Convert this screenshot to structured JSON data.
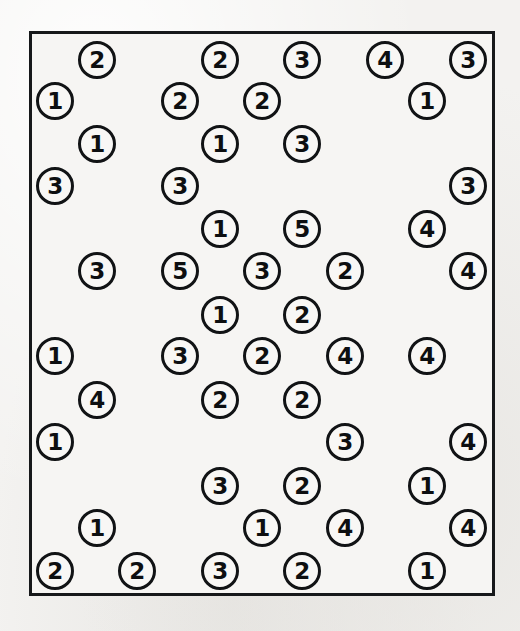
{
  "image": {
    "kind": "scanned-worksheet-scatter-of-numbered-circles",
    "background_color": "#f3f2f0",
    "frame": {
      "name": "bounding-rectangle",
      "stroke_color": "#16181a",
      "fill_color": "#f6f5f3",
      "x": 29,
      "y": 31,
      "width": 466,
      "height": 565,
      "border_width": 3
    },
    "token_style": {
      "diameter": 38,
      "stroke_color": "#111315",
      "fill_color": "#f8f7f5",
      "text_color": "#0d0f11",
      "border_width": 3
    },
    "total_tokens": 50,
    "digit_counts": {
      "1": 14,
      "2": 15,
      "3": 11,
      "4": 8,
      "5": 2
    }
  },
  "tokens": [
    {
      "label": "2",
      "x": 97,
      "y": 60
    },
    {
      "label": "2",
      "x": 220,
      "y": 60
    },
    {
      "label": "3",
      "x": 302,
      "y": 60
    },
    {
      "label": "4",
      "x": 385,
      "y": 60
    },
    {
      "label": "3",
      "x": 468,
      "y": 60
    },
    {
      "label": "1",
      "x": 55,
      "y": 101
    },
    {
      "label": "2",
      "x": 180,
      "y": 101
    },
    {
      "label": "2",
      "x": 262,
      "y": 101
    },
    {
      "label": "1",
      "x": 427,
      "y": 101
    },
    {
      "label": "1",
      "x": 97,
      "y": 144
    },
    {
      "label": "1",
      "x": 220,
      "y": 144
    },
    {
      "label": "3",
      "x": 302,
      "y": 144
    },
    {
      "label": "3",
      "x": 55,
      "y": 186
    },
    {
      "label": "3",
      "x": 180,
      "y": 186
    },
    {
      "label": "3",
      "x": 468,
      "y": 186
    },
    {
      "label": "1",
      "x": 220,
      "y": 229
    },
    {
      "label": "5",
      "x": 302,
      "y": 229
    },
    {
      "label": "4",
      "x": 427,
      "y": 229
    },
    {
      "label": "3",
      "x": 97,
      "y": 271
    },
    {
      "label": "5",
      "x": 180,
      "y": 271
    },
    {
      "label": "3",
      "x": 262,
      "y": 271
    },
    {
      "label": "2",
      "x": 345,
      "y": 271
    },
    {
      "label": "4",
      "x": 468,
      "y": 271
    },
    {
      "label": "1",
      "x": 220,
      "y": 315
    },
    {
      "label": "2",
      "x": 302,
      "y": 315
    },
    {
      "label": "1",
      "x": 55,
      "y": 356
    },
    {
      "label": "3",
      "x": 180,
      "y": 356
    },
    {
      "label": "2",
      "x": 262,
      "y": 356
    },
    {
      "label": "4",
      "x": 345,
      "y": 356
    },
    {
      "label": "4",
      "x": 427,
      "y": 356
    },
    {
      "label": "4",
      "x": 97,
      "y": 400
    },
    {
      "label": "2",
      "x": 220,
      "y": 400
    },
    {
      "label": "2",
      "x": 302,
      "y": 400
    },
    {
      "label": "1",
      "x": 55,
      "y": 442
    },
    {
      "label": "3",
      "x": 345,
      "y": 442
    },
    {
      "label": "4",
      "x": 468,
      "y": 442
    },
    {
      "label": "3",
      "x": 220,
      "y": 486
    },
    {
      "label": "2",
      "x": 302,
      "y": 486
    },
    {
      "label": "1",
      "x": 427,
      "y": 486
    },
    {
      "label": "1",
      "x": 97,
      "y": 528
    },
    {
      "label": "1",
      "x": 262,
      "y": 528
    },
    {
      "label": "4",
      "x": 345,
      "y": 528
    },
    {
      "label": "4",
      "x": 468,
      "y": 528
    },
    {
      "label": "2",
      "x": 55,
      "y": 571
    },
    {
      "label": "2",
      "x": 137,
      "y": 571
    },
    {
      "label": "3",
      "x": 220,
      "y": 571
    },
    {
      "label": "2",
      "x": 302,
      "y": 571
    },
    {
      "label": "1",
      "x": 427,
      "y": 571
    }
  ]
}
